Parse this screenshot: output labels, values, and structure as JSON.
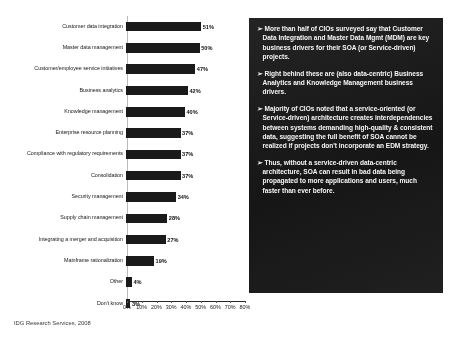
{
  "chart_data": {
    "type": "bar",
    "orientation": "horizontal",
    "title": "",
    "xlabel": "",
    "ylabel": "",
    "xlim": [
      0,
      80
    ],
    "grid": false,
    "legend": false,
    "categories": [
      "Customer data integration",
      "Master data management",
      "Customer/employee service initiatives",
      "Business analytics",
      "Knowledge management",
      "Enterprise resource planning",
      "Compliance with regulatory requirements",
      "Consolidation",
      "Security management",
      "Supply chain management",
      "Integrating a merger and acquisition",
      "Mainframe rationalization",
      "Other",
      "Don't know"
    ],
    "values": [
      51,
      50,
      47,
      42,
      40,
      37,
      37,
      37,
      34,
      28,
      27,
      19,
      4,
      3
    ],
    "value_labels": [
      "51%",
      "50%",
      "47%",
      "42%",
      "40%",
      "37%",
      "37%",
      "37%",
      "34%",
      "28%",
      "27%",
      "19%",
      "4%",
      "3%"
    ],
    "xticks": [
      0,
      10,
      20,
      30,
      40,
      50,
      60,
      70,
      80
    ],
    "xtick_labels": [
      "0%",
      "10%",
      "20%",
      "30%",
      "40%",
      "50%",
      "60%",
      "70%",
      "80%"
    ],
    "bar_color": "#1c1c1c"
  },
  "source_note": "IDG Research Services, 2008",
  "panel": {
    "background_color": "#1e1e1e",
    "text_color": "#f2f2f2",
    "bullet_glyph": "➢",
    "paragraphs": [
      "More than half of CIOs surveyed say that Customer Data Integration and Master Data Mgmt (MDM) are key business drivers for their SOA (or Service-driven) projects.",
      "Right behind these are (also data-centric) Business Analytics and Knowledge Management business drivers.",
      "Majority of CIOs noted that a service-oriented (or Service-driven) architecture creates interdependencies between systems demanding high-quality & consistent data, suggesting the full benefit of SOA cannot be realized if projects don't incorporate an EDM strategy.",
      "Thus, without a service-driven data-centric architecture, SOA can result in bad data being propagated to more applications and users, much faster than ever before."
    ]
  }
}
